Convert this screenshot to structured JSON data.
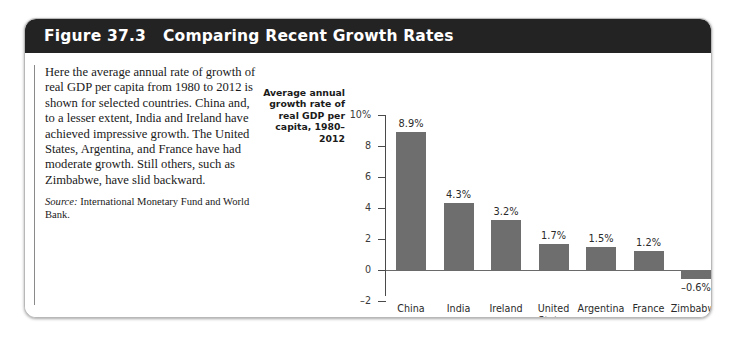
{
  "figure": {
    "number": "Figure 37.3",
    "title": "Comparing Recent Growth Rates"
  },
  "caption": {
    "body": "Here the average annual rate of growth of real GDP per capita from 1980 to 2012 is shown for selected countries. China and, to a lesser extent, India and Ireland have achieved impressive growth. The United States, Argentina, and France have had moderate growth. Still others, such as Zimbabwe, have slid backward.",
    "source_label": "Source:",
    "source_text": " International Monetary Fund and World Bank."
  },
  "chart_data": {
    "type": "bar",
    "title": "",
    "ylabel": "Average annual growth rate of real GDP per capita, 1980–2012",
    "xlabel": "",
    "categories": [
      "China",
      "India",
      "Ireland",
      "United States",
      "Argentina",
      "France",
      "Zimbabwe"
    ],
    "values": [
      8.9,
      4.3,
      3.2,
      1.7,
      1.5,
      1.2,
      -0.6
    ],
    "value_labels": [
      "8.9%",
      "4.3%",
      "3.2%",
      "1.7%",
      "1.5%",
      "1.2%",
      "–0.6%"
    ],
    "ylim": [
      -2,
      10
    ],
    "yticks": [
      10,
      8,
      6,
      4,
      2,
      0,
      -2
    ],
    "ytick_labels": [
      "10%",
      "8",
      "6",
      "4",
      "2",
      "0",
      "–2"
    ],
    "grid": false,
    "legend": null,
    "bar_color": "#6e6e6e",
    "axis_color": "#4a4a4a"
  },
  "colors": {
    "header_bg": "#232323",
    "header_text": "#ffffff",
    "card_bg": "#ffffff",
    "bar": "#6e6e6e"
  }
}
